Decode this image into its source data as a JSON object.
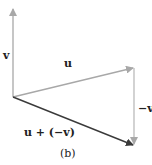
{
  "diagram": {
    "caption": "(b)",
    "labels": {
      "v": "v",
      "u": "u",
      "neg_v": "−v",
      "sum": "u + (−v)"
    },
    "colors": {
      "gray_vector": "#a8a8a8",
      "dark_vector": "#3a3a3a",
      "text": "#222222"
    },
    "vectors": [
      {
        "name": "v",
        "from": [
          13,
          97
        ],
        "to": [
          13,
          8
        ]
      },
      {
        "name": "u",
        "from": [
          13,
          97
        ],
        "to": [
          134,
          68
        ]
      },
      {
        "name": "-v",
        "from": [
          134,
          68
        ],
        "to": [
          134,
          145
        ]
      },
      {
        "name": "u + (-v)",
        "from": [
          13,
          97
        ],
        "to": [
          134,
          145
        ]
      }
    ]
  }
}
